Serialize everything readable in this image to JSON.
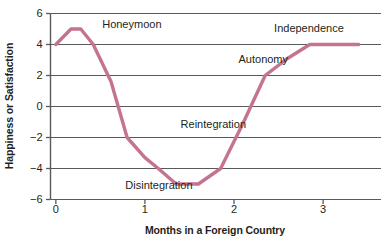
{
  "chart_data": {
    "type": "line",
    "title": "",
    "subtitle": "",
    "xlabel": "Months in a Foreign Country",
    "ylabel": "Happiness or Satisfaction",
    "xlim": [
      -0.06,
      3.65
    ],
    "ylim": [
      -6,
      6
    ],
    "xticks": [
      0,
      1,
      2,
      3
    ],
    "xtick_labels": [
      "0",
      "1",
      "2",
      "3"
    ],
    "yticks": [
      -6,
      -4,
      -2,
      0,
      2,
      4,
      6
    ],
    "ytick_labels": [
      "−6",
      "−4",
      "−2",
      "0",
      "2",
      "4",
      "6"
    ],
    "grid": "horizontal",
    "legend": "none",
    "line_color": "#c4748f",
    "grid_color": "#58595b",
    "axis_color": "#58595b",
    "series": [
      {
        "name": "Culture shock curve",
        "x": [
          0.0,
          0.17,
          0.28,
          0.42,
          0.62,
          0.8,
          1.0,
          1.15,
          1.35,
          1.6,
          1.85,
          2.1,
          2.35,
          2.6,
          2.85,
          3.4
        ],
        "y": [
          4.0,
          5.0,
          5.0,
          4.0,
          1.6,
          -2.0,
          -3.3,
          -4.0,
          -5.0,
          -5.0,
          -4.0,
          -1.1,
          2.0,
          3.1,
          4.0,
          4.0
        ]
      }
    ],
    "annotations": [
      {
        "text": "Honeymoon",
        "x": 0.52,
        "y": 5.25,
        "name": "honeymoon"
      },
      {
        "text": "Independence",
        "x": 2.45,
        "y": 5.0,
        "name": "independence"
      },
      {
        "text": "Autonomy",
        "x": 2.05,
        "y": 3.0,
        "name": "autonomy"
      },
      {
        "text": "Reintegration",
        "x": 1.4,
        "y": -1.2,
        "name": "reintegration"
      },
      {
        "text": "Disintegration",
        "x": 0.78,
        "y": -5.1,
        "name": "disintegration"
      }
    ]
  }
}
